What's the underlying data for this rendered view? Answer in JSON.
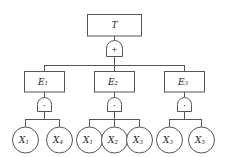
{
  "diagram": {
    "type": "fault-tree",
    "title_node": {
      "label": "T",
      "shape": "rect"
    },
    "gates": {
      "or_symbol": "+",
      "and_symbol": "·",
      "or_name": "OR",
      "and_name": "AND"
    },
    "colors": {
      "stroke": "#555555",
      "fill": "#ffffff",
      "text": "#1a1a1a",
      "background": "#ffffff"
    },
    "intermediate_events": [
      {
        "base": "E",
        "sub": "1"
      },
      {
        "base": "E",
        "sub": "2"
      },
      {
        "base": "E",
        "sub": "3"
      }
    ],
    "basic_event_groups": [
      {
        "parent": "E1",
        "events": [
          {
            "base": "X",
            "sub": "1"
          },
          {
            "base": "X",
            "sub": "4"
          }
        ]
      },
      {
        "parent": "E2",
        "events": [
          {
            "base": "X",
            "sub": "1"
          },
          {
            "base": "X",
            "sub": "2"
          },
          {
            "base": "X",
            "sub": "3"
          }
        ]
      },
      {
        "parent": "E3",
        "events": [
          {
            "base": "X",
            "sub": "3"
          },
          {
            "base": "X",
            "sub": "5"
          }
        ]
      }
    ]
  }
}
